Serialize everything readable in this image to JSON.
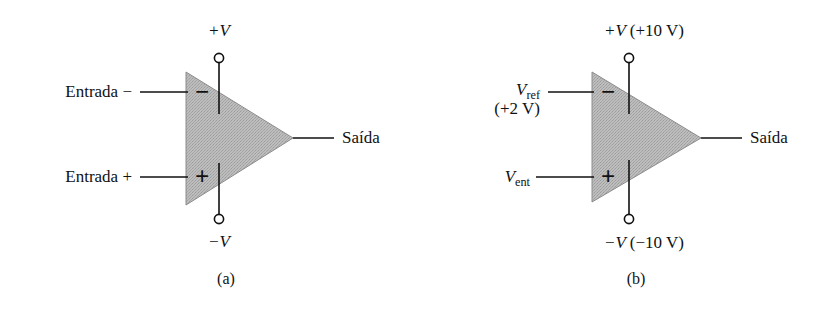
{
  "figure": {
    "type": "electronic-schematic",
    "fill_color": "#b2b2b2",
    "line_color": "#111111",
    "background": "#ffffff"
  },
  "panels": [
    {
      "id": "a",
      "caption": "(a)",
      "supply_top": "+V",
      "supply_bottom": "−V",
      "input_inverting": "Entrada −",
      "input_noninverting": "Entrada +",
      "output": "Saída",
      "symbol_minus": "−",
      "symbol_plus": "+"
    },
    {
      "id": "b",
      "caption": "(b)",
      "supply_top_var": "+V",
      "supply_top_value": "(+10 V)",
      "supply_bottom_var": "−V",
      "supply_bottom_value": "(−10 V)",
      "input_inverting_var": "V",
      "input_inverting_sub": "ref",
      "input_inverting_value": "(+2 V)",
      "input_noninverting_var": "V",
      "input_noninverting_sub": "ent",
      "output": "Saída",
      "symbol_minus": "−",
      "symbol_plus": "+"
    }
  ]
}
